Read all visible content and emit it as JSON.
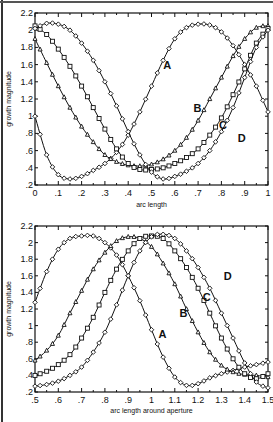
{
  "chart_data": [
    {
      "type": "line",
      "title": "",
      "xlabel": "arc length",
      "ylabel": "growth magnitude",
      "xlim": [
        0,
        1
      ],
      "ylim": [
        0.2,
        2.2
      ],
      "x_ticks": [
        "0",
        ".1",
        ".2",
        ".3",
        ".4",
        ".5",
        ".6",
        ".7",
        ".8",
        ".9",
        "1"
      ],
      "y_ticks": [
        ".2",
        ".4",
        ".6",
        ".8",
        "1",
        "1.2",
        "1.4",
        "1.6",
        "1.8",
        "2",
        "2.2"
      ],
      "grid": false,
      "legend": "inline labels",
      "x": [
        0,
        0.05,
        0.1,
        0.15,
        0.2,
        0.25,
        0.3,
        0.35,
        0.4,
        0.45,
        0.5,
        0.55,
        0.6,
        0.65,
        0.7,
        0.75,
        0.8,
        0.85,
        0.9,
        0.95,
        1.0
      ],
      "series": [
        {
          "name": "A",
          "marker": "diamond",
          "label_pos": [
            0.55,
            1.55
          ],
          "values": [
            1.0,
            0.55,
            0.32,
            0.27,
            0.3,
            0.37,
            0.45,
            0.58,
            0.78,
            1.05,
            1.35,
            1.65,
            1.9,
            2.03,
            2.07,
            2.06,
            1.98,
            1.82,
            1.6,
            1.35,
            1.05
          ]
        },
        {
          "name": "B",
          "marker": "triangle",
          "label_pos": [
            0.68,
            1.05
          ],
          "values": [
            1.9,
            1.62,
            1.35,
            1.1,
            0.88,
            0.7,
            0.55,
            0.47,
            0.43,
            0.42,
            0.44,
            0.5,
            0.6,
            0.75,
            0.95,
            1.2,
            1.45,
            1.7,
            1.9,
            2.03,
            2.05
          ]
        },
        {
          "name": "C",
          "marker": "square",
          "label_pos": [
            0.79,
            0.85
          ],
          "values": [
            2.05,
            1.95,
            1.78,
            1.58,
            1.35,
            1.1,
            0.85,
            0.62,
            0.45,
            0.38,
            0.38,
            0.4,
            0.45,
            0.52,
            0.62,
            0.78,
            0.98,
            1.25,
            1.55,
            1.85,
            2.02
          ]
        },
        {
          "name": "D",
          "marker": "diamond",
          "label_pos": [
            0.87,
            0.7
          ],
          "values": [
            2.02,
            2.08,
            2.07,
            2.0,
            1.85,
            1.65,
            1.4,
            1.12,
            0.82,
            0.55,
            0.35,
            0.27,
            0.3,
            0.36,
            0.45,
            0.6,
            0.82,
            1.1,
            1.45,
            1.8,
            2.0
          ]
        }
      ]
    },
    {
      "type": "line",
      "title": "",
      "xlabel": "arc length around aperture",
      "ylabel": "growth magnitude",
      "xlim": [
        0.5,
        1.5
      ],
      "ylim": [
        0.2,
        2.2
      ],
      "x_ticks": [
        ".5",
        ".6",
        ".7",
        ".8",
        ".9",
        "1",
        "1.1",
        "1.2",
        "1.3",
        "1.4",
        "1.5"
      ],
      "y_ticks": [
        ".2",
        ".4",
        ".6",
        ".8",
        "1",
        "1.2",
        "1.4",
        "1.6",
        "1.8",
        "2",
        "2.2"
      ],
      "grid": false,
      "legend": "inline labels",
      "x": [
        0.5,
        0.55,
        0.6,
        0.65,
        0.7,
        0.75,
        0.8,
        0.85,
        0.9,
        0.95,
        1.0,
        1.05,
        1.1,
        1.15,
        1.2,
        1.25,
        1.3,
        1.35,
        1.4,
        1.45,
        1.5
      ],
      "series": [
        {
          "name": "A",
          "marker": "diamond",
          "label_pos": [
            1.03,
            0.85
          ],
          "values": [
            1.28,
            1.65,
            1.92,
            2.05,
            2.08,
            2.08,
            2.0,
            1.85,
            1.6,
            1.3,
            0.95,
            0.62,
            0.38,
            0.28,
            0.3,
            0.37,
            0.42,
            0.46,
            0.5,
            0.53,
            0.56
          ]
        },
        {
          "name": "B",
          "marker": "triangle",
          "label_pos": [
            1.12,
            1.1
          ],
          "values": [
            0.58,
            0.7,
            0.88,
            1.15,
            1.42,
            1.68,
            1.88,
            2.02,
            2.07,
            2.05,
            1.95,
            1.75,
            1.5,
            1.2,
            0.92,
            0.68,
            0.52,
            0.44,
            0.41,
            0.4,
            0.38
          ]
        },
        {
          "name": "C",
          "marker": "square",
          "label_pos": [
            1.22,
            1.3
          ],
          "values": [
            0.4,
            0.45,
            0.53,
            0.65,
            0.85,
            1.1,
            1.4,
            1.68,
            1.9,
            2.05,
            2.08,
            2.05,
            1.9,
            1.7,
            1.45,
            1.15,
            0.85,
            0.6,
            0.42,
            0.36,
            0.42
          ]
        },
        {
          "name": "D",
          "marker": "diamond",
          "label_pos": [
            1.31,
            1.55
          ],
          "values": [
            0.27,
            0.29,
            0.33,
            0.4,
            0.5,
            0.68,
            0.92,
            1.25,
            1.6,
            1.9,
            2.07,
            2.1,
            2.05,
            1.9,
            1.7,
            1.45,
            1.15,
            0.85,
            0.55,
            0.32,
            0.25
          ]
        }
      ]
    }
  ],
  "panels": {
    "top": {
      "xlabel": "arc length",
      "ylabel": "growth magnitude"
    },
    "bottom": {
      "xlabel": "arc length around aperture",
      "ylabel": "growth magnitude"
    }
  }
}
